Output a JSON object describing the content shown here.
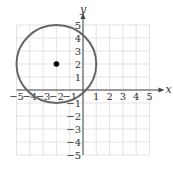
{
  "chart_data": {
    "type": "scatter",
    "title": "",
    "xlabel": "x",
    "ylabel": "y",
    "xlim": [
      -5,
      5
    ],
    "ylim": [
      -5,
      5
    ],
    "grid": true,
    "x_ticks": [
      "-5",
      "-4",
      "-3",
      "-2",
      "-1",
      "1",
      "2",
      "3",
      "4",
      "5"
    ],
    "y_ticks": [
      "5",
      "4",
      "3",
      "2",
      "1",
      "-1",
      "-2",
      "-3",
      "-4",
      "-5"
    ],
    "shapes": [
      {
        "type": "circle",
        "center": [
          -2,
          2
        ],
        "radius": 3,
        "stroke": "#666666"
      }
    ],
    "points": [
      {
        "x": -2,
        "y": 2,
        "label": "center",
        "color": "#000000"
      }
    ]
  }
}
